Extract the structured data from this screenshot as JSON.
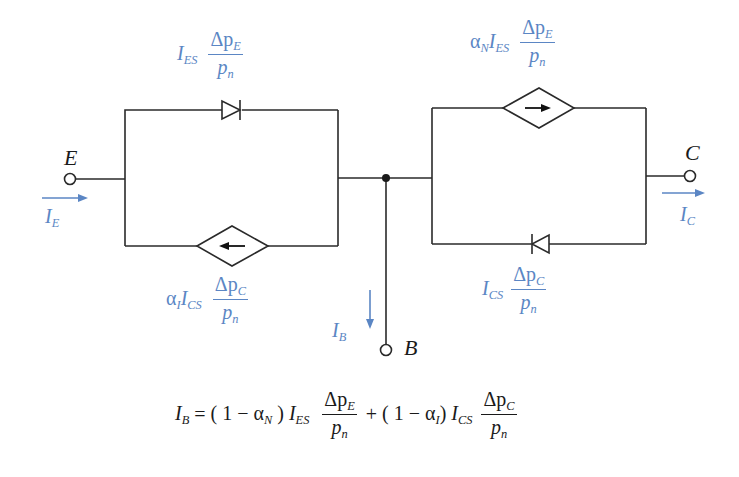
{
  "colors": {
    "wire": "#2a2a2a",
    "annotation": "#5b86c4",
    "text": "#1a1a1a"
  },
  "terminals": {
    "emitter": {
      "label": "E"
    },
    "collector": {
      "label": "C"
    },
    "base": {
      "label": "B"
    }
  },
  "currents": {
    "emitter": {
      "symbol": "I",
      "sub": "E"
    },
    "collector": {
      "symbol": "I",
      "sub": "C"
    },
    "base": {
      "symbol": "I",
      "sub": "B"
    }
  },
  "components": {
    "emitter_diode": {
      "prefix": "I",
      "prefix_sub": "ES",
      "num": "Δp",
      "num_sub": "E",
      "den": "p",
      "den_sub": "n"
    },
    "emitter_source": {
      "coef": "α",
      "coef_sub": "I",
      "prefix": "I",
      "prefix_sub": "CS",
      "num": "Δp",
      "num_sub": "C",
      "den": "p",
      "den_sub": "n"
    },
    "collector_source": {
      "coef": "α",
      "coef_sub": "N",
      "prefix": "I",
      "prefix_sub": "ES",
      "num": "Δp",
      "num_sub": "E",
      "den": "p",
      "den_sub": "n"
    },
    "collector_diode": {
      "prefix": "I",
      "prefix_sub": "CS",
      "num": "Δp",
      "num_sub": "C",
      "den": "p",
      "den_sub": "n"
    }
  },
  "equation": {
    "lhs": "I",
    "lhs_sub": "B",
    "equals": "=",
    "term1_open": "( 1 − α",
    "term1_sub": "N",
    "term1_close": ")",
    "term1_I": "I",
    "term1_I_sub": "ES",
    "term1_num": "Δp",
    "term1_num_sub": "E",
    "term1_den": "p",
    "term1_den_sub": "n",
    "plus": "+",
    "term2_open": "( 1 − α",
    "term2_sub": "I",
    "term2_close": ")",
    "term2_I": "I",
    "term2_I_sub": "CS",
    "term2_num": "Δp",
    "term2_num_sub": "C",
    "term2_den": "p",
    "term2_den_sub": "n"
  }
}
